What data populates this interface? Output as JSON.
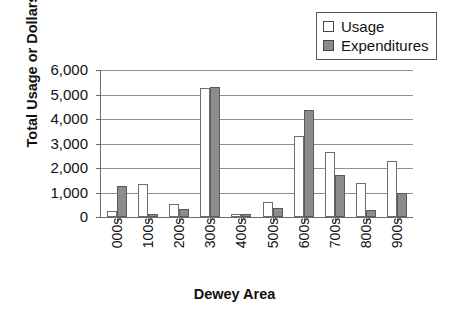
{
  "chart_data": {
    "type": "bar",
    "title": "",
    "xlabel": "Dewey Area",
    "ylabel": "Total Usage or Dollars",
    "categories": [
      "000s",
      "100s",
      "200s",
      "300s",
      "400s",
      "500s",
      "600s",
      "700s",
      "800s",
      "900s"
    ],
    "series": [
      {
        "name": "Usage",
        "color": "#ffffff",
        "values": [
          250,
          1350,
          520,
          5270,
          140,
          620,
          3300,
          2650,
          1400,
          2300
        ]
      },
      {
        "name": "Expenditures",
        "color": "#8c8c8c",
        "values": [
          1250,
          110,
          310,
          5300,
          110,
          380,
          4370,
          1700,
          270,
          980
        ]
      }
    ],
    "ylim": [
      0,
      6000
    ],
    "ytick_labels": [
      "6,000",
      "5,000",
      "4,000",
      "3,000",
      "2,000",
      "1,000",
      "0"
    ],
    "ytick_values": [
      6000,
      5000,
      4000,
      3000,
      2000,
      1000,
      0
    ],
    "grid": "horizontal",
    "legend_position": "top-right"
  },
  "legend": {
    "items": [
      {
        "label": "Usage",
        "swatch": "usage-swatch"
      },
      {
        "label": "Expenditures",
        "swatch": "expenditures-swatch"
      }
    ]
  },
  "colors": {
    "usage_fill": "#ffffff",
    "expenditures_fill": "#8c8c8c",
    "axis": "#6a6a6a",
    "grid": "#8f8f8f",
    "text": "#111111"
  }
}
